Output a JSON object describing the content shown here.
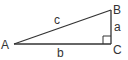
{
  "diagram": {
    "type": "right-triangle",
    "vertices": [
      {
        "id": "A",
        "label": "A"
      },
      {
        "id": "B",
        "label": "B"
      },
      {
        "id": "C",
        "label": "C"
      }
    ],
    "sides": [
      {
        "id": "a",
        "label": "a",
        "between": [
          "B",
          "C"
        ]
      },
      {
        "id": "b",
        "label": "b",
        "between": [
          "A",
          "C"
        ]
      },
      {
        "id": "c",
        "label": "c",
        "between": [
          "A",
          "B"
        ]
      }
    ],
    "right_angle_at": "C",
    "colors": {
      "line": "#333333",
      "background": "#ffffff"
    }
  }
}
